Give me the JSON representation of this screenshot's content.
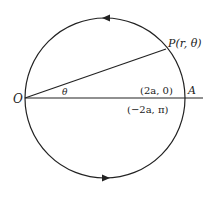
{
  "figure": {
    "labels": {
      "origin": "O",
      "point_p": "P(r, θ)",
      "angle": "θ",
      "point_a": "A",
      "coord_a_pos": "(2a, 0)",
      "coord_a_neg": "(−2a, π)"
    },
    "colors": {
      "stroke": "#222222",
      "background": "#ffffff"
    }
  }
}
